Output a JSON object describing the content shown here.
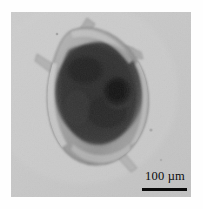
{
  "figure": {
    "kind": "photomicrograph",
    "modality": "light-microscopy-brightfield",
    "background_color": "#c9c9c9",
    "paper_color": "#fefefe",
    "plate": {
      "x": 11,
      "y": 12,
      "width": 180,
      "height": 185
    }
  },
  "scale_bar": {
    "value": "100",
    "unit": "µm",
    "label": "100 µm",
    "bar_color": "#0a0a0a",
    "text_color": "#0b0b0b",
    "bar_length_px": 45,
    "bar_thickness_px": 3,
    "position": "bottom-right"
  },
  "specimen": {
    "body_outline_color": "#8e8e8e",
    "lorica_highlight_color": "#c2c2c2",
    "gut_mass_color": "#2e2e2e",
    "dark_organ_color": "#161616",
    "features": [
      {
        "name": "lorica",
        "label": "translucent shell"
      },
      {
        "name": "gut-mass",
        "label": "dark internal gut contents"
      },
      {
        "name": "dark-organ",
        "label": "dark rounded organ"
      },
      {
        "name": "anterior-spine",
        "label": "anterior spine"
      },
      {
        "name": "lateral-spine",
        "label": "lateral spine"
      },
      {
        "name": "posterior-spine",
        "label": "posterior spine"
      },
      {
        "name": "antenna",
        "label": "translucent antenna"
      }
    ]
  }
}
